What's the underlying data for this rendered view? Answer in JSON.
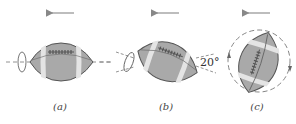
{
  "diagram": {
    "colors": {
      "ball_fill": "#a8a8a8",
      "ball_stroke": "#555555",
      "stripe": "#e6e6e6",
      "laces": "#5a5a5a",
      "axis_dash": "#777777",
      "arrow": "#888888"
    },
    "panels": [
      {
        "id": "a",
        "label": "(a)",
        "motion": "left",
        "orientation": "horizontal",
        "spin": "about long axis"
      },
      {
        "id": "b",
        "label": "(b)",
        "motion": "left",
        "orientation": "tilted",
        "tilt_angle": "20°",
        "spin": "about long axis"
      },
      {
        "id": "c",
        "label": "(c)",
        "motion": "left",
        "orientation": "near vertical",
        "spin": "end-over-end (tumbling)"
      }
    ]
  }
}
